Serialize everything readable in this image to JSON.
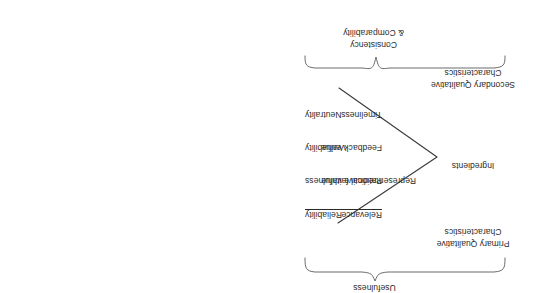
{
  "diagram": {
    "orientation_note": "rotated-180",
    "colors": {
      "text": "#2b2b2b",
      "brace_stroke": "#5a5a5a",
      "chevron_stroke": "#3a3a3a",
      "background": "#ffffff"
    },
    "top_brace_label": "Consistency\n& Comparability",
    "top_brace_label_line1": "Consistency",
    "top_brace_label_line2": "& Comparability",
    "bottom_brace_label": "Usefulness",
    "column_left": {
      "items": [
        {
          "label": "Neutrality",
          "underlined": false
        },
        {
          "label": "Verifiability",
          "underlined": false
        },
        {
          "label": "Representational faithfulness",
          "underlined": false
        },
        {
          "label": "Reliability",
          "underlined": true
        }
      ]
    },
    "column_right": {
      "items": [
        {
          "label": "Timeliness",
          "underlined": false
        },
        {
          "label": "Feedback value",
          "underlined": false
        },
        {
          "label": "Predictive value",
          "underlined": false
        },
        {
          "label": "Relevance",
          "underlined": true
        }
      ]
    },
    "side_labels": {
      "secondary_line1": "Secondary Qualitative",
      "secondary_line2": "Characteristics",
      "ingredients": "Ingredients",
      "primary_line1": "Primary Qualitative",
      "primary_line2": "Characteristics"
    }
  }
}
